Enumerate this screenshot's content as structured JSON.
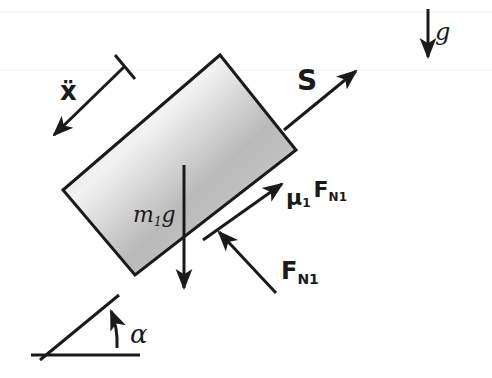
{
  "diagram": {
    "gravity": {
      "label": "g",
      "direction": "down"
    },
    "acceleration": {
      "label": "ẍ",
      "direction": "down-slope"
    },
    "block": {
      "fill": "#bdbdbd",
      "stroke": "#1a1a1a"
    },
    "forces": [
      {
        "id": "rope",
        "label": "S",
        "direction": "up-slope"
      },
      {
        "id": "weight",
        "label_main": "m",
        "label_sub": "1",
        "label_tail": "g",
        "direction": "down"
      },
      {
        "id": "friction",
        "label_mu": "μ",
        "label_mu_sub": "1",
        "label_F": "F",
        "label_F_sub": "N1",
        "direction": "up-slope"
      },
      {
        "id": "normal",
        "label_F": "F",
        "label_F_sub": "N1",
        "direction": "perpendicular-into-block"
      }
    ],
    "angle": {
      "label": "α"
    }
  }
}
